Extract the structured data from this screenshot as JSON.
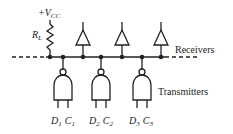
{
  "diagram": {
    "supply_label": "+V",
    "supply_sub": "CC",
    "resistor_label": "R",
    "resistor_sub": "L",
    "receivers_label": "Receivers",
    "transmitters_label": "Transmitters",
    "transmitters": [
      {
        "d": "D",
        "d_sub": "1",
        "c": "C",
        "c_sub": "1"
      },
      {
        "d": "D",
        "d_sub": "2",
        "c": "C",
        "c_sub": "2"
      },
      {
        "d": "D",
        "d_sub": "3",
        "c": "C",
        "c_sub": "3"
      }
    ],
    "colors": {
      "line": "#222222",
      "background": "#ffffff"
    }
  }
}
